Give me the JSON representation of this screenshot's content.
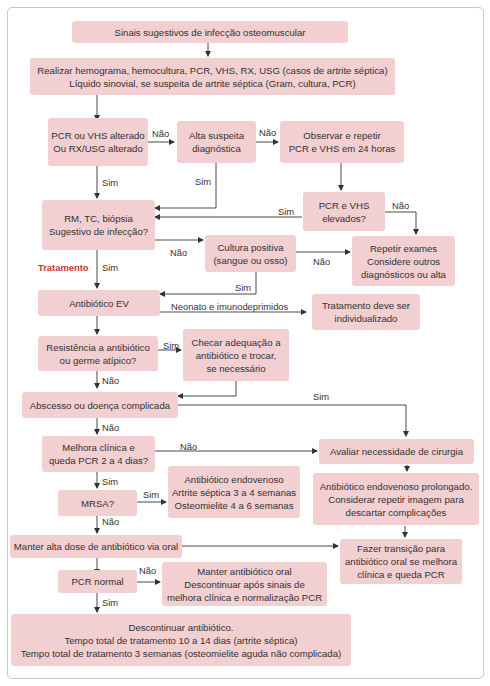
{
  "flowchart": {
    "nodes": {
      "start": "Sinais sugestivos de infecção osteomuscular",
      "exams": "Realizar hemograma, hemocultura, PCR, VHS, RX, USG (casos de artrite séptica)\nLíquido sinovial, se suspeita de artrite séptica (Gram, cultura, PCR)",
      "pcr_vhs_altered": "PCR ou VHS alterado\nOu RX/USG alterado",
      "high_suspicion": "Alta suspeita\ndiagnóstica",
      "observe_repeat": "Observar e repetir\nPCR e VHS em 24 horas",
      "pcr_vhs_elevated": "PCR e VHS\nelevados?",
      "imaging": "RM, TC, biópsia\nSugestivo de infecção?",
      "culture_positive": "Cultura positiva\n(sangue ou osso)",
      "repeat_exams": "Repetir exames\nConsidere outros\ndiagnósticos ou alta",
      "iv_antibiotic": "Antibiótico EV",
      "individualized": "Tratamento deve ser\nindividualizado",
      "resistance": "Resistência a antibiótico\nou germe atípico?",
      "check_adequacy": "Checar adequação a\nantibiótico e trocar,\nse necessário",
      "abscess": "Abscesso ou doença complicada",
      "clinical_improvement": "Melhora clínica e\nqueda PCR 2 a 4 dias?",
      "evaluate_surgery": "Avaliar necessidade de cirurgia",
      "mrsa": "MRSA?",
      "iv_duration": "Antibiótico endovenoso\nArtrite séptica 3 a 4 semanas\nOsteomielite 4 a 6 semanas",
      "prolonged_iv": "Antibiótico endovenoso prolongado.\nConsiderar repetir imagem para\ndescartar complicações",
      "high_dose_oral": "Manter alta dose de antibiótico via oral",
      "oral_transition": "Fazer transição para\nantibiótico oral se melhora\nclínica e queda PCR",
      "pcr_normal": "PCR normal",
      "maintain_oral": "Manter antibiótico oral\nDescontinuar após sinais de\nmelhora clínica e normalização PCR",
      "discontinue": "Descontinuar antibiótico.\nTempo total de tratamento 10 a 14 dias (artrite séptica)\nTempo total de tratamento 3 semanas (osteomielite aguda não complicada)"
    },
    "edge_labels": {
      "no": "Não",
      "yes": "Sim",
      "neonates": "Neonato e imunodeprimidos",
      "treatment": "Tratamento"
    },
    "colors": {
      "box_fill": "#f2cfd0",
      "text": "#333333",
      "accent": "#c0392b",
      "line": "#333333"
    }
  }
}
